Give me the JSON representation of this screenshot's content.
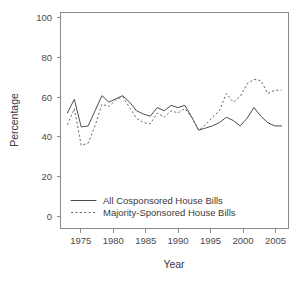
{
  "chart_data": {
    "type": "line",
    "title": "",
    "xlabel": "Year",
    "ylabel": "Percentage",
    "xlim": [
      1972,
      2005
    ],
    "ylim": [
      0,
      100
    ],
    "grid": false,
    "legend_position": "bottom-left",
    "xticks": [
      1975,
      1980,
      1985,
      1990,
      1995,
      2000,
      2005
    ],
    "yticks": [
      0,
      20,
      40,
      60,
      80,
      100
    ],
    "x": [
      1973,
      1974,
      1975,
      1976,
      1977,
      1978,
      1979,
      1980,
      1981,
      1982,
      1983,
      1984,
      1985,
      1986,
      1987,
      1988,
      1989,
      1990,
      1991,
      1992,
      1993,
      1994,
      1995,
      1996,
      1997,
      1998,
      1999,
      2000,
      2001,
      2002,
      2003,
      2004
    ],
    "series": [
      {
        "name": "All Cosponsored House Bills",
        "style": "solid",
        "color": "#4d4d4d",
        "values": [
          53.5,
          59.8,
          47.0,
          47.5,
          54.5,
          61.5,
          58.5,
          60.0,
          61.5,
          58.5,
          54.5,
          53.0,
          52.0,
          56.0,
          54.5,
          57.0,
          56.0,
          57.0,
          51.5,
          45.5,
          46.5,
          47.5,
          49.0,
          51.5,
          50.0,
          47.5,
          51.0,
          56.0,
          52.0,
          49.0,
          47.5,
          47.5
        ]
      },
      {
        "name": "Majority-Sponsored House Bills",
        "style": "dashed",
        "color": "#6b6b6b",
        "values": [
          48.0,
          55.5,
          38.5,
          39.5,
          47.5,
          57.5,
          56.5,
          59.5,
          61.0,
          56.0,
          51.0,
          49.0,
          48.5,
          53.5,
          51.5,
          54.5,
          53.5,
          55.5,
          51.5,
          45.5,
          48.0,
          51.5,
          54.5,
          62.5,
          58.5,
          61.0,
          67.0,
          69.0,
          68.5,
          62.5,
          64.0,
          64.0
        ]
      }
    ]
  },
  "axes": {
    "ylabel": "Percentage",
    "xlabel": "Year",
    "ytick_labels": [
      "0",
      "20",
      "40",
      "60",
      "80",
      "100"
    ],
    "xtick_labels": [
      "1975",
      "1980",
      "1985",
      "1990",
      "1995",
      "2000",
      "2005"
    ]
  },
  "legend": {
    "entries": [
      {
        "label": "All Cosponsored House Bills",
        "style": "solid"
      },
      {
        "label": "Majority-Sponsored House Bills",
        "style": "dashed"
      }
    ]
  },
  "caption": {
    "partial_text": ""
  }
}
